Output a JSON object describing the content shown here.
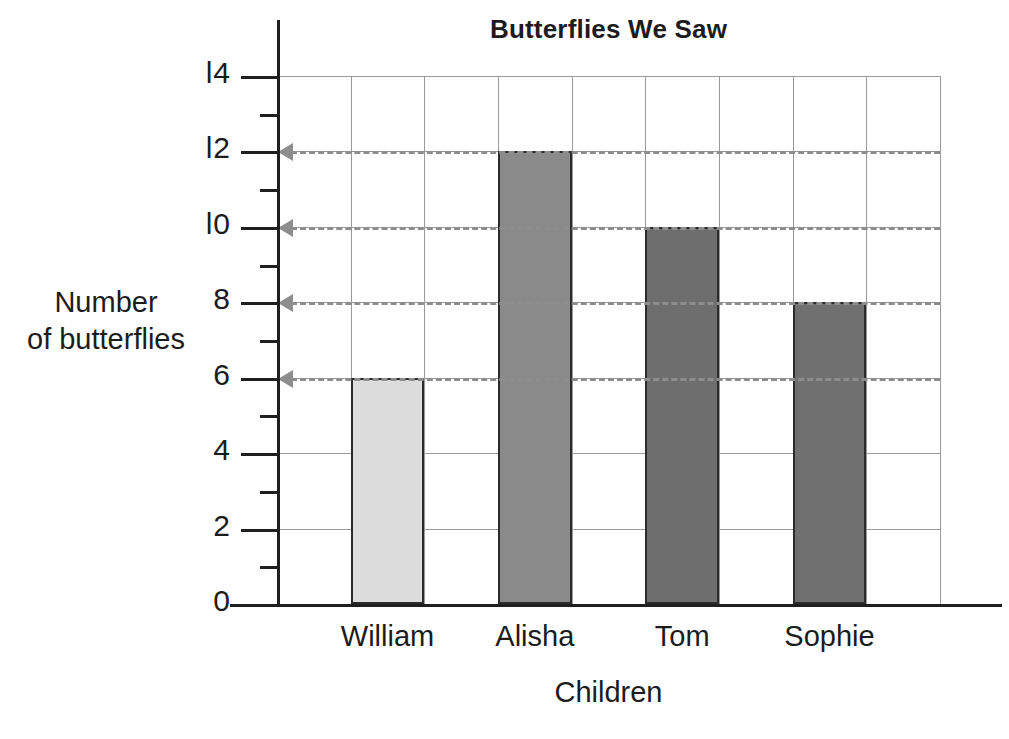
{
  "chart_data": {
    "type": "bar",
    "title": "Butterflies We Saw",
    "xlabel": "Children",
    "ylabel": "Number\nof butterflies",
    "ylabel_lines": [
      "Number",
      "of butterflies"
    ],
    "categories": [
      "William",
      "Alisha",
      "Tom",
      "Sophie"
    ],
    "values": [
      6,
      12,
      10,
      8
    ],
    "ylim": [
      0,
      14
    ],
    "ytick_major_values": [
      0,
      2,
      4,
      6,
      8,
      10,
      12,
      14
    ],
    "ytick_major_labels": [
      "0",
      "2",
      "4",
      "6",
      "8",
      "l0",
      "l2",
      "l4"
    ],
    "ytick_minor_values": [
      1,
      3,
      5,
      7,
      9,
      11,
      13
    ],
    "grid": true,
    "legend": "none",
    "bar_colors": [
      "#dcdcdc",
      "#8a8a8a",
      "#6e6e6e",
      "#707070"
    ],
    "bar_border_color": "#2b2b2b",
    "gridline_color": "#9a9a9a",
    "axis_color": "#1f1f1f",
    "annotation_color": "#8d8d8d",
    "annotations": [
      {
        "kind": "reference-arrow",
        "value": 12,
        "label": "arrow-to-12"
      },
      {
        "kind": "reference-arrow",
        "value": 10,
        "label": "arrow-to-10"
      },
      {
        "kind": "reference-arrow",
        "value": 8,
        "label": "arrow-to-8"
      },
      {
        "kind": "reference-arrow",
        "value": 6,
        "label": "arrow-to-6"
      }
    ]
  }
}
